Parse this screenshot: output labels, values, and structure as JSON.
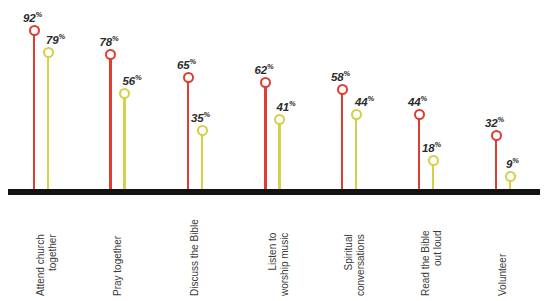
{
  "chart_data": {
    "type": "bar",
    "subtype": "lollipop",
    "title": "",
    "subtitle": "",
    "xlabel": "",
    "ylabel": "",
    "ylim": [
      0,
      100
    ],
    "grid": false,
    "legend": "none",
    "value_suffix": "%",
    "categories": [
      "Attend church together",
      "Pray together",
      "Discuss the Bible",
      "Listen to worship music",
      "Spiritual conversations",
      "Read the Bible out loud",
      "Volunteer"
    ],
    "category_lines": [
      [
        "Attend church",
        "together"
      ],
      [
        "Pray together"
      ],
      [
        "Discuss the Bible"
      ],
      [
        "Listen to",
        "worship music"
      ],
      [
        "Spiritual",
        "conversations"
      ],
      [
        "Read the Bible",
        "out loud"
      ],
      [
        "Volunteer"
      ]
    ],
    "series": [
      {
        "name": "series-red",
        "color": "#e03c31",
        "values": [
          92,
          78,
          65,
          62,
          58,
          44,
          32
        ],
        "labels": [
          "92",
          "78",
          "65",
          "62",
          "58",
          "44",
          "32"
        ]
      },
      {
        "name": "series-yellow",
        "color": "#d4d047",
        "values": [
          79,
          56,
          35,
          41,
          44,
          18,
          9
        ],
        "labels": [
          "79",
          "56",
          "35",
          "41",
          "44",
          "18",
          "9"
        ]
      }
    ]
  },
  "axis": {
    "baseline_color": "#121212"
  }
}
